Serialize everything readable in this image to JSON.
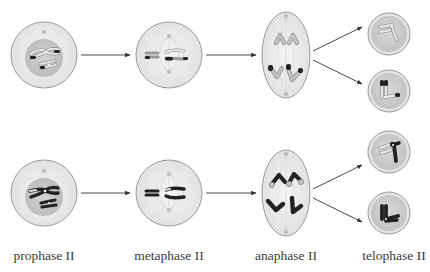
{
  "figure": {
    "stages": [
      {
        "id": "prophase",
        "label": "prophase II"
      },
      {
        "id": "metaphase",
        "label": "metaphase II"
      },
      {
        "id": "anaphase",
        "label": "anaphase II"
      },
      {
        "id": "telophase",
        "label": "telophase II"
      }
    ],
    "rows": 2,
    "colors": {
      "cell_fill": "#ececec",
      "cell_stroke": "#9a9a9a",
      "nucleus_fill": "#c8c8c8",
      "daughter_fill": "#cfcfcf",
      "chromosome_light": "#b9b9b9",
      "chromosome_dark": "#2a2a2a",
      "arrow": "#333333",
      "spindle": "#d4d4d4"
    }
  }
}
